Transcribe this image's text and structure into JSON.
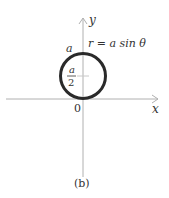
{
  "figure": {
    "caption": "(b)",
    "equation": "r = a sin θ",
    "axes": {
      "x_label": "x",
      "y_label": "y",
      "origin_label": "0"
    },
    "circle": {
      "top_label": "a",
      "center_label_numerator": "a",
      "center_label_denominator": "2"
    },
    "colors": {
      "axis": "#b0b0b0",
      "curve": "#2a2a2a",
      "text": "#333333"
    }
  }
}
